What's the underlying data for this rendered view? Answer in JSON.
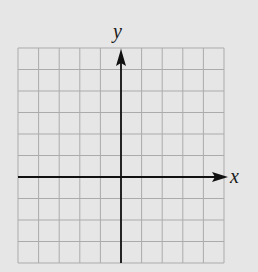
{
  "chart_data": {
    "type": "coordinate-grid",
    "title": "",
    "xlabel": "x",
    "ylabel": "y",
    "grid": true,
    "columns": 10,
    "rows": 10,
    "origin_column": 5,
    "origin_row_from_top": 6,
    "x_arrow": true,
    "y_arrow": true,
    "tick_labels": []
  },
  "colors": {
    "background": "#e6e6e6",
    "grid": "#ababab",
    "axis": "#111111"
  },
  "axes": {
    "x_label": "x",
    "y_label": "y"
  }
}
